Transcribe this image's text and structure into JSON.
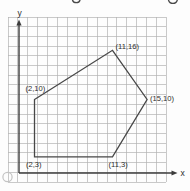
{
  "figure": {
    "kind": "coordinate-grid-plot",
    "axis_labels": {
      "x": "x",
      "y": "y"
    },
    "artifacts": {
      "copyright_mark": "small gray circle at bottom-left",
      "cropped_text_fragments": "two partial glyph bottoms along top edge"
    }
  },
  "chart_data": {
    "type": "line",
    "title": "",
    "xlabel": "x",
    "ylabel": "y",
    "grid": true,
    "axis_style": "arrows from origin, unnumbered unit grid",
    "series": [
      {
        "name": "pentagon",
        "closed": true,
        "points": [
          [
            2,
            10
          ],
          [
            11,
            16
          ],
          [
            15,
            10
          ],
          [
            11,
            3
          ],
          [
            2,
            3
          ]
        ]
      }
    ],
    "point_labels": [
      "(2,10)",
      "(11,16)",
      "(15,10)",
      "(11,3)",
      "(2,3)"
    ],
    "xlim": [
      0,
      16
    ],
    "ylim": [
      0,
      17
    ]
  },
  "colors": {
    "background": "#fdfdfd",
    "grid": "#b2b2b2",
    "axis": "#3c3c3c",
    "shape": "#474747",
    "label": "#2e2e2e",
    "copyright_mark": "#c4c4c4",
    "fragment": "#4a4a4a"
  }
}
